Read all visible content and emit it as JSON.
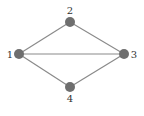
{
  "diagram": {
    "type": "undirected-graph",
    "colors": {
      "node": "#6e6e6e",
      "edge": "#8a8a8a",
      "label": "#333333"
    },
    "nodes": [
      {
        "id": "1",
        "label": "1",
        "x": 19,
        "y": 54,
        "lx": 10,
        "ly": 58
      },
      {
        "id": "2",
        "label": "2",
        "x": 70,
        "y": 22,
        "lx": 70,
        "ly": 14
      },
      {
        "id": "3",
        "label": "3",
        "x": 124,
        "y": 54,
        "lx": 134,
        "ly": 58
      },
      {
        "id": "4",
        "label": "4",
        "x": 70,
        "y": 87,
        "lx": 70,
        "ly": 102
      }
    ],
    "edges": [
      {
        "from": "1",
        "to": "2"
      },
      {
        "from": "2",
        "to": "3"
      },
      {
        "from": "1",
        "to": "3"
      },
      {
        "from": "1",
        "to": "4"
      },
      {
        "from": "4",
        "to": "3"
      }
    ]
  }
}
